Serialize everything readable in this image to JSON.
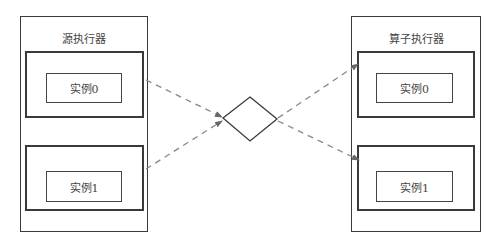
{
  "diagram": {
    "source_executor": {
      "title": "源执行器",
      "instances": [
        {
          "label": "实例0"
        },
        {
          "label": "实例1"
        }
      ]
    },
    "operator_executor": {
      "title": "算子执行器",
      "instances": [
        {
          "label": "实例0"
        },
        {
          "label": "实例1"
        }
      ]
    },
    "connector": {
      "shape": "diamond"
    },
    "edges": [
      {
        "from": "源执行器.实例0",
        "to": "diamond",
        "style": "dashed"
      },
      {
        "from": "源执行器.实例1",
        "to": "diamond",
        "style": "dashed"
      },
      {
        "from": "diamond",
        "to": "算子执行器.实例0",
        "style": "dashed"
      },
      {
        "from": "diamond",
        "to": "算子执行器.实例1",
        "style": "dashed"
      }
    ],
    "colors": {
      "stroke": "#3a3a3a",
      "edge": "#888888",
      "background": "#ffffff"
    }
  }
}
